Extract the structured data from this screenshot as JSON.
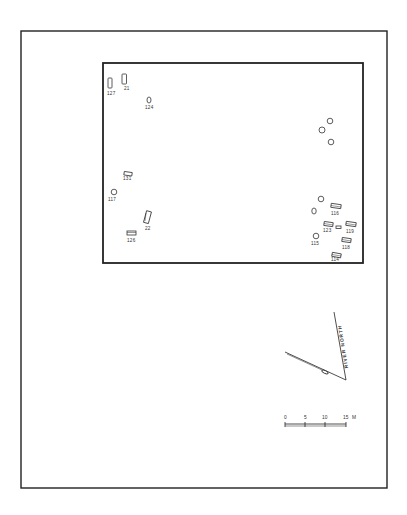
{
  "diagram": {
    "type": "archaeological site plan",
    "colors": {
      "ink": "#222222",
      "background": "#ffffff"
    },
    "outer_frame": {
      "x": 21,
      "y": 31,
      "w": 366,
      "h": 457
    },
    "site_boundary": {
      "x": 103,
      "y": 63,
      "w": 260,
      "h": 200
    },
    "features": [
      {
        "id": "127",
        "shape": "rect-vertical",
        "x": 110,
        "y": 82,
        "label": "127"
      },
      {
        "id": "21",
        "shape": "rect-vertical",
        "x": 124,
        "y": 79,
        "label": "21"
      },
      {
        "id": "124",
        "shape": "oval",
        "x": 149,
        "y": 102,
        "label": "124"
      },
      {
        "id": "unl-1",
        "shape": "circle",
        "x": 330,
        "y": 121,
        "label": ""
      },
      {
        "id": "unl-2",
        "shape": "circle",
        "x": 322,
        "y": 130,
        "label": ""
      },
      {
        "id": "unl-3",
        "shape": "circle",
        "x": 331,
        "y": 142,
        "label": ""
      },
      {
        "id": "131",
        "shape": "rect-horizontal",
        "x": 127,
        "y": 174,
        "label": "131"
      },
      {
        "id": "117",
        "shape": "circle",
        "x": 114,
        "y": 193,
        "label": "117"
      },
      {
        "id": "22",
        "shape": "rect-vertical-tilted",
        "x": 147,
        "y": 217,
        "label": "22"
      },
      {
        "id": "126",
        "shape": "rect-horizontal",
        "x": 132,
        "y": 233,
        "label": "126"
      },
      {
        "id": "unl-4",
        "shape": "circle",
        "x": 321,
        "y": 200,
        "label": ""
      },
      {
        "id": "unl-5",
        "shape": "oval",
        "x": 314,
        "y": 211,
        "label": ""
      },
      {
        "id": "116",
        "shape": "rect-horizontal-tilted",
        "x": 336,
        "y": 207,
        "label": "116"
      },
      {
        "id": "123",
        "shape": "rect-horizontal-tilted",
        "x": 328,
        "y": 224,
        "label": "123"
      },
      {
        "id": "unl-6",
        "shape": "small-rect",
        "x": 339,
        "y": 227,
        "label": ""
      },
      {
        "id": "119",
        "shape": "rect-horizontal-tilted",
        "x": 351,
        "y": 225,
        "label": "119"
      },
      {
        "id": "115",
        "shape": "circle",
        "x": 316,
        "y": 237,
        "label": "115"
      },
      {
        "id": "118",
        "shape": "rect-horizontal-tilted",
        "x": 346,
        "y": 241,
        "label": "118"
      },
      {
        "id": "114",
        "shape": "rect-horizontal-tilted",
        "x": 336,
        "y": 256,
        "label": "114"
      }
    ],
    "north_arrow": {
      "label": "RIVER NORTH",
      "vertex": {
        "x": 346,
        "y": 380
      },
      "river_north_end": {
        "x": 334,
        "y": 312
      },
      "magnetic_end": {
        "x": 285,
        "y": 352
      }
    },
    "scale_bar": {
      "ticks": [
        "0",
        "5",
        "10",
        "15"
      ],
      "unit": "M",
      "x_start": 285,
      "x_end": 346,
      "y": 424
    }
  }
}
